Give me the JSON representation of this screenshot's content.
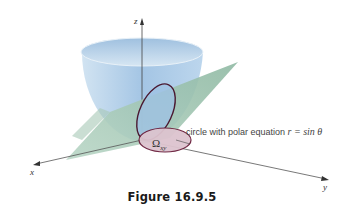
{
  "figure": {
    "caption": "Figure 16.9.5",
    "annotation_prefix": "circle with polar equation ",
    "annotation_math": "r = sin θ",
    "region_label_main": "Ω",
    "region_label_sub": "xy",
    "axes": {
      "x": "x",
      "y": "y",
      "z": "z"
    },
    "colors": {
      "bowl": "#a9c9e6",
      "bowl_inner": "#c4dcef",
      "plane": "#9fc4b0",
      "circle_outline": "#6a1f3c",
      "region_fill": "#ddc4cf",
      "axis": "#444444"
    }
  }
}
